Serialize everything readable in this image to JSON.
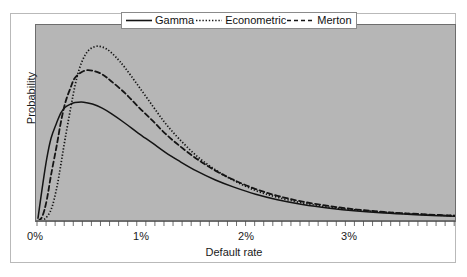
{
  "chart_data": {
    "type": "line",
    "title": "",
    "xlabel": "Default rate",
    "ylabel": "Probability",
    "xlim": [
      0,
      3.85
    ],
    "ylim": [
      0,
      1.0
    ],
    "xticks": [
      "0%",
      "1%",
      "2%",
      "3%"
    ],
    "xtick_values": [
      0,
      1,
      2,
      3
    ],
    "yticks": [],
    "grid": false,
    "legend_position": "top-center",
    "plot_background": "#b6b6b6",
    "series": [
      {
        "name": "Gamma",
        "style": "solid",
        "color": "#141414",
        "peak_x": 0.42,
        "peak_y": 0.63,
        "x": [
          0.0,
          0.04,
          0.08,
          0.12,
          0.17,
          0.21,
          0.25,
          0.3,
          0.34,
          0.42,
          0.5,
          0.59,
          0.67,
          0.8,
          0.92,
          1.05,
          1.17,
          1.3,
          1.46,
          1.63,
          1.8,
          2.0,
          2.2,
          2.43,
          2.68,
          2.93,
          3.18,
          3.43,
          3.68,
          3.85
        ],
        "y": [
          0.015,
          0.18,
          0.33,
          0.44,
          0.52,
          0.575,
          0.605,
          0.622,
          0.63,
          0.632,
          0.622,
          0.6,
          0.572,
          0.52,
          0.468,
          0.415,
          0.365,
          0.318,
          0.265,
          0.218,
          0.18,
          0.142,
          0.113,
          0.088,
          0.068,
          0.053,
          0.042,
          0.034,
          0.028,
          0.025
        ]
      },
      {
        "name": "Econometric",
        "style": "dotted",
        "color": "#141414",
        "peak_x": 0.55,
        "peak_y": 0.93,
        "x": [
          0.0,
          0.06,
          0.12,
          0.17,
          0.21,
          0.25,
          0.3,
          0.34,
          0.38,
          0.43,
          0.48,
          0.55,
          0.63,
          0.71,
          0.8,
          0.92,
          1.05,
          1.17,
          1.3,
          1.46,
          1.63,
          1.8,
          2.0,
          2.2,
          2.43,
          2.68,
          2.93,
          3.18,
          3.43,
          3.68,
          3.85
        ],
        "y": [
          0.0,
          0.01,
          0.06,
          0.17,
          0.3,
          0.44,
          0.6,
          0.72,
          0.81,
          0.88,
          0.915,
          0.93,
          0.915,
          0.875,
          0.815,
          0.72,
          0.615,
          0.52,
          0.435,
          0.345,
          0.272,
          0.215,
          0.162,
          0.126,
          0.096,
          0.073,
          0.058,
          0.047,
          0.038,
          0.031,
          0.028
        ]
      },
      {
        "name": "Merton",
        "style": "dashed",
        "color": "#141414",
        "peak_x": 0.5,
        "peak_y": 0.8,
        "x": [
          0.0,
          0.04,
          0.08,
          0.12,
          0.17,
          0.21,
          0.25,
          0.3,
          0.34,
          0.42,
          0.5,
          0.59,
          0.67,
          0.8,
          0.92,
          1.05,
          1.17,
          1.3,
          1.46,
          1.63,
          1.8,
          2.0,
          2.2,
          2.43,
          2.68,
          2.93,
          3.18,
          3.43,
          3.68,
          3.85
        ],
        "y": [
          0.0,
          0.025,
          0.11,
          0.245,
          0.395,
          0.525,
          0.628,
          0.71,
          0.762,
          0.798,
          0.8,
          0.78,
          0.745,
          0.68,
          0.608,
          0.535,
          0.465,
          0.4,
          0.33,
          0.268,
          0.218,
          0.17,
          0.134,
          0.103,
          0.079,
          0.061,
          0.048,
          0.039,
          0.032,
          0.028
        ]
      }
    ]
  },
  "axes": {
    "y_title": "Probability",
    "x_title": "Default rate",
    "x_tick_labels": [
      "0%",
      "1%",
      "2%",
      "3%"
    ]
  },
  "legend": {
    "items": [
      {
        "label": "Gamma",
        "style": "solid"
      },
      {
        "label": "Econometric",
        "style": "dotted"
      },
      {
        "label": "Merton",
        "style": "dashed"
      }
    ]
  }
}
